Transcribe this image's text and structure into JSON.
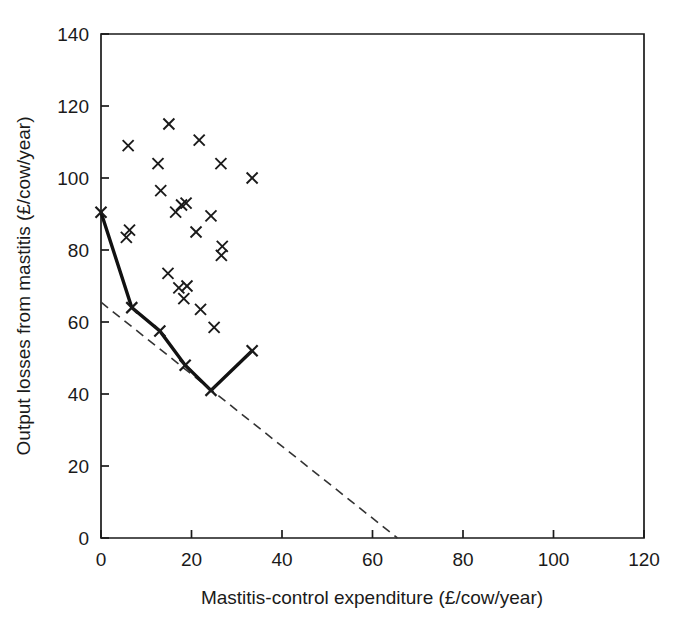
{
  "chart_data": {
    "type": "scatter",
    "title": "",
    "xlabel": "Mastitis-control expenditure (£/cow/year)",
    "ylabel": "Output losses from mastitis (£/cow/year)",
    "xlim": [
      0,
      120
    ],
    "ylim": [
      0,
      140
    ],
    "xticks": [
      0,
      20,
      40,
      60,
      80,
      100,
      120
    ],
    "yticks": [
      0,
      20,
      40,
      60,
      80,
      100,
      120,
      140
    ],
    "grid": false,
    "legend": "none",
    "series": [
      {
        "name": "Farm observations",
        "type": "scatter",
        "marker": "x",
        "color": "#1a1a1a",
        "points": [
          [
            6.0,
            109.0
          ],
          [
            6.3,
            85.5
          ],
          [
            5.6,
            83.5
          ],
          [
            12.6,
            104.0
          ],
          [
            13.2,
            96.5
          ],
          [
            15.0,
            115.0
          ],
          [
            14.8,
            73.5
          ],
          [
            16.5,
            90.5
          ],
          [
            17.8,
            92.5
          ],
          [
            18.8,
            93.0
          ],
          [
            17.2,
            69.5
          ],
          [
            19.0,
            70.0
          ],
          [
            18.3,
            66.5
          ],
          [
            21.7,
            110.5
          ],
          [
            21.0,
            85.0
          ],
          [
            22.0,
            63.5
          ],
          [
            24.3,
            89.5
          ],
          [
            26.5,
            104.0
          ],
          [
            26.8,
            81.0
          ],
          [
            26.6,
            78.5
          ],
          [
            25.0,
            58.5
          ],
          [
            33.4,
            100.0
          ]
        ]
      },
      {
        "name": "Observed loss-expenditure frontier",
        "type": "line",
        "style": "solid",
        "color": "#111111",
        "marker": "x",
        "points": [
          [
            0.0,
            90.5
          ],
          [
            6.8,
            64.0
          ],
          [
            13.0,
            57.5
          ],
          [
            18.6,
            48.0
          ],
          [
            24.3,
            41.0
          ],
          [
            33.4,
            52.0
          ]
        ]
      },
      {
        "name": "Theoretical minimum-cost line",
        "type": "line",
        "style": "dashed",
        "color": "#333333",
        "points": [
          [
            0.0,
            65.5
          ],
          [
            65.5,
            0.0
          ]
        ]
      }
    ]
  },
  "axes": {
    "x_tick_labels": [
      "0",
      "20",
      "40",
      "60",
      "80",
      "100",
      "120"
    ],
    "y_tick_labels": [
      "0",
      "20",
      "40",
      "60",
      "80",
      "100",
      "120",
      "140"
    ],
    "x_axis_title": "Mastitis-control expenditure (£/cow/year)",
    "y_axis_title": "Output losses from mastitis (£/cow/year)"
  },
  "style": {
    "axis_color": "#1a1a1a",
    "marker_color": "#1a1a1a",
    "solid_line_color": "#111111",
    "dashed_line_color": "#333333",
    "background": "#ffffff"
  }
}
